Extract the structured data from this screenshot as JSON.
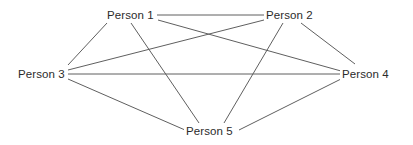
{
  "diagram": {
    "type": "graph",
    "graph_kind": "complete-graph-K5",
    "background_color": "#ffffff",
    "edge_color": "#5f5f5f",
    "label_color": "#2b2b2b",
    "edge_width": 1,
    "node_count": 5,
    "edge_count": 10,
    "nodes": [
      {
        "id": "person1",
        "label": "Person 1",
        "label_x": 107,
        "label_y": 8,
        "anchor_x": 131,
        "anchor_y": 15
      },
      {
        "id": "person2",
        "label": "Person 2",
        "label_x": 266,
        "label_y": 8,
        "anchor_x": 290,
        "anchor_y": 15
      },
      {
        "id": "person3",
        "label": "Person 3",
        "label_x": 18,
        "label_y": 67,
        "anchor_x": 42,
        "anchor_y": 74
      },
      {
        "id": "person4",
        "label": "Person 4",
        "label_x": 342,
        "label_y": 67,
        "anchor_x": 366,
        "anchor_y": 74
      },
      {
        "id": "person5",
        "label": "Person 5",
        "label_x": 186,
        "label_y": 124,
        "anchor_x": 210,
        "anchor_y": 131
      }
    ],
    "edges": [
      {
        "from": "person1",
        "to": "person2",
        "x1": 157,
        "y1": 15,
        "x2": 265,
        "y2": 15
      },
      {
        "from": "person1",
        "to": "person3",
        "x1": 107,
        "y1": 23,
        "x2": 68,
        "y2": 65
      },
      {
        "from": "person1",
        "to": "person4",
        "x1": 158,
        "y1": 20,
        "x2": 341,
        "y2": 71
      },
      {
        "from": "person1",
        "to": "person5",
        "x1": 131,
        "y1": 23,
        "x2": 199,
        "y2": 123
      },
      {
        "from": "person2",
        "to": "person3",
        "x1": 264,
        "y1": 20,
        "x2": 68,
        "y2": 70
      },
      {
        "from": "person2",
        "to": "person4",
        "x1": 301,
        "y1": 23,
        "x2": 355,
        "y2": 64
      },
      {
        "from": "person2",
        "to": "person5",
        "x1": 283,
        "y1": 23,
        "x2": 224,
        "y2": 123
      },
      {
        "from": "person3",
        "to": "person4",
        "x1": 68,
        "y1": 74,
        "x2": 341,
        "y2": 74
      },
      {
        "from": "person3",
        "to": "person5",
        "x1": 68,
        "y1": 79,
        "x2": 185,
        "y2": 130
      },
      {
        "from": "person4",
        "to": "person5",
        "x1": 341,
        "y1": 79,
        "x2": 239,
        "y2": 130
      }
    ]
  }
}
